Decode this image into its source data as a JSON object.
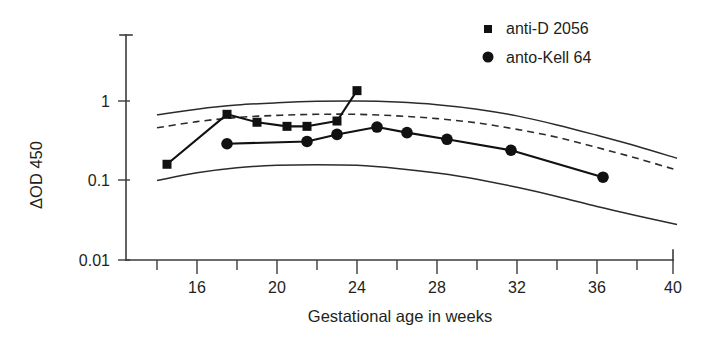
{
  "chart_data": {
    "type": "line",
    "title": "",
    "xlabel": "Gestational age in weeks",
    "ylabel": "ΔOD 450",
    "xlim": [
      14,
      40
    ],
    "ylim": [
      0.01,
      2.2
    ],
    "yscale": "log",
    "grid": false,
    "legend_position": "top-right",
    "xticks": [
      16,
      20,
      24,
      28,
      32,
      36,
      40
    ],
    "xtick_labels": [
      "16",
      "20",
      "24",
      "28",
      "32",
      "36",
      "40"
    ],
    "xminorticks": [
      14,
      18,
      22,
      26,
      30,
      34,
      38
    ],
    "yticks": [
      1,
      0.1,
      0.01
    ],
    "ytick_labels": [
      "1",
      "0.1",
      "0.01"
    ],
    "series": [
      {
        "name": "anti-D 2056",
        "marker": "square",
        "color": "#111111",
        "x": [
          14.5,
          17.5,
          19.0,
          20.5,
          21.5,
          23.0,
          24.0
        ],
        "y": [
          0.16,
          0.68,
          0.54,
          0.48,
          0.48,
          0.56,
          1.35
        ]
      },
      {
        "name": "anto-Kell 64",
        "marker": "circle",
        "color": "#111111",
        "x": [
          17.5,
          21.5,
          23.0,
          25.0,
          26.5,
          28.5,
          31.7,
          36.3
        ],
        "y": [
          0.29,
          0.31,
          0.38,
          0.47,
          0.4,
          0.33,
          0.24,
          0.11
        ]
      }
    ],
    "reference_curves": [
      {
        "name": "liley-upper-zone-boundary",
        "style": "solid",
        "x": [
          14,
          16,
          18,
          20,
          22,
          24,
          26,
          28,
          30,
          32,
          34,
          36,
          38,
          40
        ],
        "y": [
          0.67,
          0.79,
          0.89,
          0.95,
          0.99,
          1.0,
          0.97,
          0.9,
          0.79,
          0.65,
          0.5,
          0.37,
          0.27,
          0.19
        ]
      },
      {
        "name": "liley-mid-zone-boundary",
        "style": "dashed",
        "x": [
          14,
          16,
          18,
          20,
          22,
          24,
          26,
          28,
          30,
          32,
          34,
          36,
          38,
          40
        ],
        "y": [
          0.46,
          0.55,
          0.62,
          0.66,
          0.68,
          0.68,
          0.65,
          0.6,
          0.53,
          0.44,
          0.35,
          0.26,
          0.19,
          0.135
        ]
      },
      {
        "name": "liley-lower-zone-boundary",
        "style": "solid",
        "x": [
          14,
          16,
          18,
          20,
          22,
          24,
          26,
          28,
          30,
          32,
          34,
          36,
          38,
          40
        ],
        "y": [
          0.1,
          0.125,
          0.145,
          0.155,
          0.158,
          0.155,
          0.142,
          0.124,
          0.104,
          0.082,
          0.063,
          0.047,
          0.036,
          0.028
        ]
      }
    ],
    "legend": [
      {
        "label": "anti-D 2056",
        "marker": "square"
      },
      {
        "label": "anto-Kell 64",
        "marker": "circle"
      }
    ]
  },
  "axes": {
    "y_title": "ΔOD 450",
    "x_title": "Gestational age in weeks",
    "y_tick_1": "1",
    "y_tick_01": "0.1",
    "y_tick_001": "0.01",
    "x_tick_16": "16",
    "x_tick_20": "20",
    "x_tick_24": "24",
    "x_tick_28": "28",
    "x_tick_32": "32",
    "x_tick_36": "36",
    "x_tick_40": "40"
  },
  "legend": {
    "item_1_label": "anti-D 2056",
    "item_2_label": "anto-Kell 64"
  },
  "colors": {
    "ink": "#111111",
    "axis": "#3b3b3b",
    "background": "#ffffff"
  }
}
